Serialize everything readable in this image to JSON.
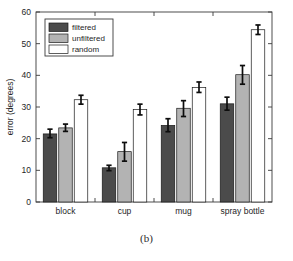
{
  "figure": {
    "caption": "(b)"
  },
  "chart_data": {
    "type": "bar",
    "title": "",
    "xlabel": "",
    "ylabel": "error (degrees)",
    "categories": [
      "block",
      "cup",
      "mug",
      "spray bottle"
    ],
    "ylim": [
      0,
      60
    ],
    "yticks": [
      0,
      10,
      20,
      30,
      40,
      50,
      60
    ],
    "ytick_labels": [
      "0",
      "10",
      "20",
      "30",
      "40",
      "50",
      "60"
    ],
    "grid": false,
    "legend_position": "upper left",
    "series": [
      {
        "name": "filtered",
        "color": "#4b4b4b",
        "values": [
          21.5,
          10.8,
          24.2,
          31.0
        ],
        "err_low": [
          20.3,
          9.9,
          22.2,
          29.0
        ],
        "err_high": [
          23.0,
          11.6,
          26.3,
          33.1
        ]
      },
      {
        "name": "unfiltered",
        "color": "#b3b3b3",
        "values": [
          23.4,
          15.9,
          29.6,
          40.2
        ],
        "err_low": [
          22.3,
          12.9,
          27.0,
          37.2
        ],
        "err_high": [
          24.6,
          18.8,
          32.0,
          43.1
        ]
      },
      {
        "name": "random",
        "color": "#ffffff",
        "values": [
          32.3,
          29.2,
          36.2,
          54.4
        ],
        "err_low": [
          30.9,
          27.5,
          34.6,
          52.9
        ],
        "err_high": [
          33.7,
          30.9,
          37.9,
          55.9
        ]
      }
    ]
  },
  "legend": {
    "items": [
      {
        "label": "filtered",
        "color": "#4b4b4b"
      },
      {
        "label": "unfiltered",
        "color": "#b3b3b3"
      },
      {
        "label": "random",
        "color": "#ffffff"
      }
    ]
  }
}
